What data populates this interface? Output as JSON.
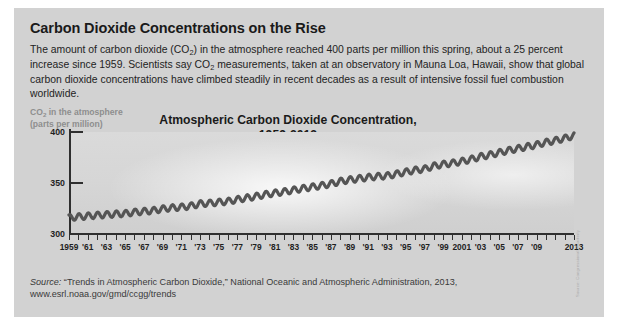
{
  "headline": "Carbon Dioxide Concentrations on the Rise",
  "deck": {
    "part1": "The amount of carbon dioxide (CO",
    "sub1": "2",
    "part2": ") in the atmosphere reached 400 parts per million this spring, about a 25 percent increase since 1959. Scientists say CO",
    "sub2": "2",
    "part3": " measurements, taken at an observatory in Mauna Loa, Hawaii, show that global carbon dioxide concentrations have climbed steadily in recent decades as a result of intensive fossil fuel combustion worldwide."
  },
  "axis_caption": {
    "part1": "CO",
    "sub": "2",
    "part2": " in the atmosphere",
    "line2": "(parts per million)"
  },
  "credit": "Source: Congressional Quarterly",
  "source": {
    "label": "Source:",
    "text": " “Trends in Atmospheric Carbon Dioxide,” National Oceanic and Atmospheric Administration, 2013, www.esrl.noaa.gov/gmd/ccgg/trends"
  },
  "chart_data": {
    "type": "line",
    "title": "Atmospheric Carbon Dioxide Concentration,",
    "subtitle": "1959-2013",
    "xlabel": "",
    "ylabel": "CO2 in the atmosphere (parts per million)",
    "xlim": [
      1959,
      2013
    ],
    "ylim": [
      300,
      400
    ],
    "yticks": [
      300,
      350,
      400
    ],
    "ytick_labels": [
      "300",
      "350",
      "400"
    ],
    "grid": false,
    "legend": null,
    "xtick_years": [
      1959,
      1961,
      1963,
      1965,
      1967,
      1969,
      1971,
      1973,
      1975,
      1977,
      1979,
      1981,
      1983,
      1985,
      1987,
      1989,
      1991,
      1993,
      1995,
      1997,
      1999,
      2001,
      2003,
      2005,
      2007,
      2009,
      2013
    ],
    "xtick_labels": [
      "1959",
      "'61",
      "'63",
      "'65",
      "'67",
      "'69",
      "'71",
      "'73",
      "'75",
      "'77",
      "'79",
      "'81",
      "'83",
      "'85",
      "'87",
      "'89",
      "'91",
      "'93",
      "'95",
      "'97",
      "'99",
      "2001",
      "'03",
      "'05",
      "'07",
      "'09",
      "2013"
    ],
    "series": [
      {
        "name": "Mauna Loa annual mean CO2",
        "color": "#555555",
        "seasonal_amplitude": 3.0,
        "x": [
          1959,
          1960,
          1961,
          1962,
          1963,
          1964,
          1965,
          1966,
          1967,
          1968,
          1969,
          1970,
          1971,
          1972,
          1973,
          1974,
          1975,
          1976,
          1977,
          1978,
          1979,
          1980,
          1981,
          1982,
          1983,
          1984,
          1985,
          1986,
          1987,
          1988,
          1989,
          1990,
          1991,
          1992,
          1993,
          1994,
          1995,
          1996,
          1997,
          1998,
          1999,
          2000,
          2001,
          2002,
          2003,
          2004,
          2005,
          2006,
          2007,
          2008,
          2009,
          2010,
          2011,
          2012,
          2013
        ],
        "values": [
          315.97,
          316.91,
          317.64,
          318.45,
          318.99,
          319.62,
          320.04,
          321.38,
          322.16,
          323.04,
          324.62,
          325.68,
          326.32,
          327.45,
          329.68,
          330.18,
          331.11,
          332.04,
          333.83,
          335.4,
          336.84,
          338.75,
          340.11,
          341.45,
          343.05,
          344.65,
          346.12,
          347.42,
          349.19,
          351.57,
          353.12,
          354.39,
          355.61,
          356.45,
          357.1,
          358.83,
          360.82,
          362.61,
          363.73,
          366.7,
          368.38,
          369.55,
          371.14,
          373.28,
          375.8,
          377.52,
          379.8,
          381.9,
          383.79,
          385.6,
          387.43,
          389.9,
          391.65,
          393.85,
          396.52
        ]
      }
    ]
  }
}
